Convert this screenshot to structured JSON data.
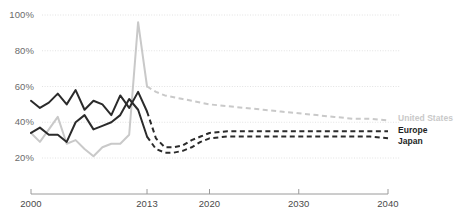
{
  "chart_data": {
    "type": "line",
    "title": "",
    "xlabel": "",
    "ylabel": "",
    "xlim": [
      2000,
      2040
    ],
    "ylim": [
      12,
      104
    ],
    "grid": "horizontal",
    "legend_position": "right",
    "y_ticks": [
      "20%",
      "40%",
      "60%",
      "80%",
      "100%"
    ],
    "y_tick_values": [
      20,
      40,
      60,
      80,
      100
    ],
    "x_ticks": [
      "2000",
      "2013",
      "2020",
      "2030",
      "2040"
    ],
    "x_tick_values": [
      2000,
      2013,
      2020,
      2030,
      2040
    ],
    "forecast_start": 2013,
    "colors": {
      "united_states": "#c9c9c9",
      "europe": "#2b2b2b",
      "japan": "#2b2b2b",
      "gridline": "#e2e2e2",
      "axis": "#9a9a9a",
      "tick_label": "#5c5c5c"
    },
    "series": [
      {
        "name": "United States",
        "color": "#c9c9c9",
        "style": "solid-then-dashed",
        "x": [
          2000,
          2001,
          2002,
          2003,
          2004,
          2005,
          2006,
          2007,
          2008,
          2009,
          2010,
          2011,
          2012,
          2013,
          2014,
          2015,
          2016,
          2017,
          2018,
          2019,
          2020,
          2022,
          2024,
          2026,
          2028,
          2030,
          2032,
          2034,
          2036,
          2038,
          2040
        ],
        "values": [
          34,
          29,
          36,
          43,
          28,
          30,
          25,
          21,
          26,
          28,
          28,
          33,
          96,
          60,
          57,
          55,
          54,
          53,
          52,
          51,
          50,
          49,
          48,
          47,
          46,
          45,
          44,
          43,
          42,
          42,
          41
        ]
      },
      {
        "name": "Europe",
        "color": "#2b2b2b",
        "style": "solid-then-dashed",
        "x": [
          2000,
          2001,
          2002,
          2003,
          2004,
          2005,
          2006,
          2007,
          2008,
          2009,
          2010,
          2011,
          2012,
          2013,
          2014,
          2015,
          2016,
          2017,
          2018,
          2019,
          2020,
          2022,
          2024,
          2026,
          2028,
          2030,
          2032,
          2034,
          2036,
          2038,
          2040
        ],
        "values": [
          52,
          48,
          51,
          56,
          50,
          58,
          47,
          52,
          50,
          44,
          55,
          48,
          57,
          46,
          31,
          26,
          26,
          27,
          30,
          32,
          34,
          35,
          35,
          35,
          35,
          35,
          35,
          35,
          35,
          35,
          35
        ]
      },
      {
        "name": "Japan",
        "color": "#2b2b2b",
        "style": "solid-then-dashed",
        "x": [
          2000,
          2001,
          2002,
          2003,
          2004,
          2005,
          2006,
          2007,
          2008,
          2009,
          2010,
          2011,
          2012,
          2013,
          2014,
          2015,
          2016,
          2017,
          2018,
          2019,
          2020,
          2022,
          2024,
          2026,
          2028,
          2030,
          2032,
          2034,
          2036,
          2038,
          2040
        ],
        "values": [
          34,
          37,
          33,
          33,
          29,
          40,
          44,
          36,
          38,
          40,
          44,
          53,
          47,
          32,
          25,
          23,
          23,
          24,
          26,
          29,
          31,
          32,
          32,
          32,
          32,
          32,
          32,
          32,
          32,
          32,
          31
        ]
      }
    ],
    "legend": [
      {
        "label": "United States",
        "color": "#c9c9c9"
      },
      {
        "label": "Europe",
        "color": "#2b2b2b"
      },
      {
        "label": "Japan",
        "color": "#2b2b2b"
      }
    ]
  }
}
